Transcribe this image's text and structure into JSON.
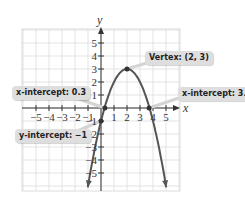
{
  "chart_data": {
    "type": "line",
    "title": "",
    "xlabel": "x",
    "ylabel": "y",
    "xlim": [
      -5,
      5
    ],
    "ylim": [
      -5,
      5
    ],
    "grid": true,
    "x_ticks": [
      -5,
      -4,
      -3,
      -2,
      -1,
      1,
      2,
      3,
      4,
      5
    ],
    "y_ticks": [
      5,
      4,
      3,
      2,
      1,
      -1,
      -2,
      -3,
      -4,
      -5
    ],
    "x_tick_labels": [
      "−5",
      "−4",
      "−3",
      "−2",
      "−1",
      "1",
      "2",
      "3",
      "4",
      "5"
    ],
    "y_tick_labels": [
      "5",
      "4",
      "3",
      "2",
      "1",
      "−1",
      "−2",
      "−3",
      "−4",
      "−5"
    ],
    "series": [
      {
        "name": "parabola",
        "equation": "y = -(x-2)^2 + 3",
        "x": [
          -0.4,
          0,
          0.3,
          1,
          2,
          3,
          3.7,
          4,
          4.4
        ],
        "y": [
          -2.76,
          -1,
          0.11,
          2,
          3,
          2,
          0.11,
          -1,
          -2.76
        ]
      }
    ],
    "points": [
      {
        "x": 2,
        "y": 3,
        "label": "Vertex: (2, 3)"
      },
      {
        "x": 0.3,
        "y": 0,
        "label": "x-intercept: 0.3"
      },
      {
        "x": 3.7,
        "y": 0,
        "label": "x-intercept: 3.7"
      },
      {
        "x": 0,
        "y": -1,
        "label": "y-intercept: −1"
      }
    ],
    "annotations": [
      "Vertex: (2, 3)",
      "x-intercept: 0.3",
      "x-intercept: 3.7",
      "y-intercept: −1"
    ]
  },
  "labels": {
    "vertex": "Vertex: (2, 3)",
    "x_intercept_left": "x-intercept: 0.3",
    "x_intercept_right": "x-intercept: 3.7",
    "y_intercept": "y-intercept: −1",
    "x_axis": "x",
    "y_axis": "y"
  },
  "colors": {
    "curve": "#555555",
    "grid": "#dcdcdc",
    "axis": "#333333",
    "callout_bg": "#dedede"
  }
}
